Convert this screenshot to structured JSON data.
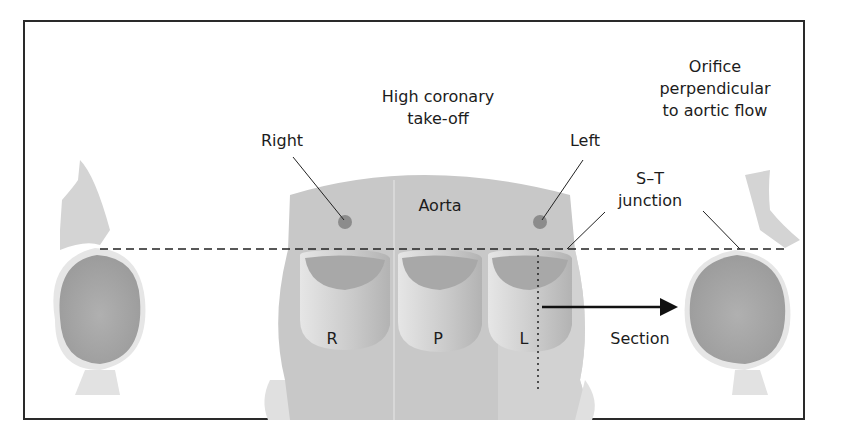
{
  "figure": {
    "labels": {
      "high_coronary_line1": "High coronary",
      "high_coronary_line2": "take-off",
      "orifice_line1": "Orifice",
      "orifice_line2": "perpendicular",
      "orifice_line3": "to aortic flow",
      "right": "Right",
      "left": "Left",
      "aorta": "Aorta",
      "st_line1": "S–T",
      "st_line2": "junction",
      "cusp_r": "R",
      "cusp_p": "P",
      "cusp_l": "L",
      "section": "Section"
    },
    "colors": {
      "tissue_light": "#d9d9d9",
      "tissue_mid": "#c4c4c4",
      "tissue_dark": "#a6a6a6",
      "ostium": "#8c8c8c",
      "line": "#222222"
    }
  }
}
